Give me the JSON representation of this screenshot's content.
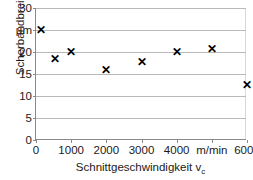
{
  "chart_data": {
    "type": "scatter",
    "title": "",
    "xlabel": "Schnittgeschwindigkeit v",
    "xlabel_sub": "c",
    "ylabel": "Scherbandbreite",
    "yunit": "µm",
    "xunit": "m/min",
    "xlim": [
      0,
      6000
    ],
    "ylim": [
      0,
      30
    ],
    "grid": "horizontal",
    "legend": "none",
    "marker": "x",
    "marker_color": "#000000",
    "gridline_color": "#b9b9b9",
    "axis_color": "#8a8a8a",
    "xticks": [
      {
        "value": 0,
        "label": "0"
      },
      {
        "value": 1000,
        "label": "1000"
      },
      {
        "value": 2000,
        "label": "2000"
      },
      {
        "value": 3000,
        "label": "3000"
      },
      {
        "value": 4000,
        "label": "4000"
      },
      {
        "value": 5000,
        "label": "m/min"
      },
      {
        "value": 6000,
        "label": "6000"
      }
    ],
    "yticks": [
      {
        "value": 0,
        "label": "0"
      },
      {
        "value": 5,
        "label": "5"
      },
      {
        "value": 10,
        "label": "10"
      },
      {
        "value": 15,
        "label": "15"
      },
      {
        "value": 20,
        "label": "20"
      },
      {
        "value": 25,
        "label": "µm"
      },
      {
        "value": 30,
        "label": "30"
      }
    ],
    "points": [
      {
        "x": 150,
        "y": 25.0
      },
      {
        "x": 550,
        "y": 18.3
      },
      {
        "x": 1000,
        "y": 20.0
      },
      {
        "x": 2000,
        "y": 15.9
      },
      {
        "x": 3000,
        "y": 17.6
      },
      {
        "x": 4000,
        "y": 19.8
      },
      {
        "x": 5000,
        "y": 20.5
      },
      {
        "x": 6000,
        "y": 12.3
      }
    ],
    "marker_glyph": "✕"
  }
}
